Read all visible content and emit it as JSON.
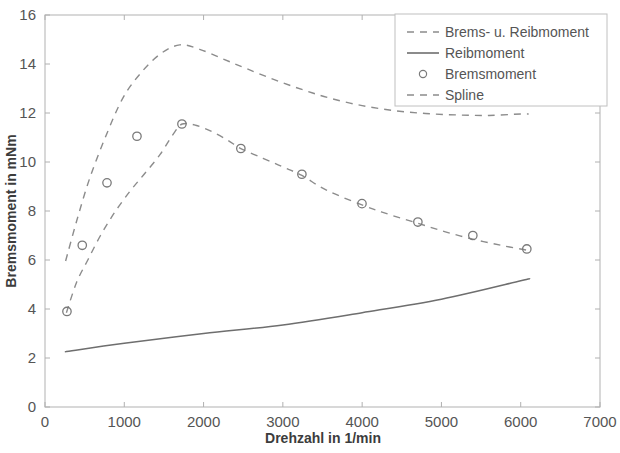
{
  "chart_data": {
    "type": "line",
    "title": "",
    "xlabel": "Drehzahl in 1/min",
    "ylabel": "Bremsmoment in mNm",
    "xlim": [
      0,
      7000
    ],
    "ylim": [
      0,
      16
    ],
    "xticks": [
      0,
      1000,
      2000,
      3000,
      4000,
      5000,
      6000,
      7000
    ],
    "yticks": [
      0,
      2,
      4,
      6,
      8,
      10,
      12,
      14,
      16
    ],
    "grid": false,
    "legend_position": "top-right",
    "series": [
      {
        "name": "Brems- u. Reibmoment",
        "style": "dashed",
        "color": "#8c8c8c",
        "x": [
          260,
          400,
          560,
          760,
          980,
          1200,
          1450,
          1700,
          1950,
          2250,
          2550,
          2900,
          3250,
          3600,
          4000,
          4400,
          4800,
          5200,
          5600,
          6000,
          6100
        ],
        "y": [
          5.96,
          7.6,
          9.3,
          11.0,
          12.6,
          13.6,
          14.4,
          14.78,
          14.6,
          14.2,
          13.8,
          13.35,
          12.95,
          12.6,
          12.3,
          12.1,
          11.98,
          11.92,
          11.9,
          11.96,
          11.96
        ]
      },
      {
        "name": "Reibmoment",
        "style": "solid",
        "color": "#6e6e6e",
        "x": [
          250,
          1000,
          2000,
          3000,
          4000,
          5000,
          6000,
          6100
        ],
        "y": [
          2.25,
          2.6,
          3.0,
          3.35,
          3.85,
          4.4,
          5.15,
          5.23
        ]
      },
      {
        "name": "Spline",
        "style": "dashed",
        "color": "#8c8c8c",
        "x": [
          270,
          400,
          540,
          700,
          880,
          1070,
          1250,
          1450,
          1620,
          1730,
          1900,
          2100,
          2300,
          2470,
          2750,
          3000,
          3240,
          3550,
          3998,
          4350,
          4703,
          5050,
          5396,
          5750,
          6077
        ],
        "y": [
          3.85,
          5.1,
          6.0,
          7.0,
          7.95,
          8.8,
          9.5,
          10.3,
          11.15,
          11.55,
          11.5,
          11.25,
          10.9,
          10.55,
          10.15,
          9.8,
          9.45,
          8.85,
          8.25,
          7.85,
          7.5,
          7.15,
          6.85,
          6.6,
          6.4
        ]
      },
      {
        "name": "Bremsmoment",
        "style": "markers",
        "marker": "circle",
        "color": "#7a7a7a",
        "x": [
          277,
          470,
          782,
          1160,
          1727,
          2470,
          3240,
          3998,
          4703,
          5396,
          6077
        ],
        "y": [
          3.9,
          6.6,
          9.15,
          11.05,
          11.55,
          10.55,
          9.5,
          8.3,
          7.55,
          7.0,
          6.45
        ]
      }
    ]
  },
  "legend": {
    "entries": [
      {
        "label": "Brems- u. Reibmoment",
        "kind": "dashed"
      },
      {
        "label": "Reibmoment",
        "kind": "solid"
      },
      {
        "label": "Bremsmoment",
        "kind": "marker"
      },
      {
        "label": "Spline",
        "kind": "dashed"
      }
    ]
  },
  "axes": {
    "x_tick_labels": [
      "0",
      "1000",
      "2000",
      "3000",
      "4000",
      "5000",
      "6000",
      "7000"
    ],
    "y_tick_labels": [
      "0",
      "2",
      "4",
      "6",
      "8",
      "10",
      "12",
      "14",
      "16"
    ],
    "x_title": "Drehzahl in 1/min",
    "y_title": "Bremsmoment in mNm"
  },
  "colors": {
    "line_gray": "#8c8c8c",
    "solid_gray": "#6e6e6e",
    "frame": "#b8b8b8",
    "text": "#555555"
  }
}
